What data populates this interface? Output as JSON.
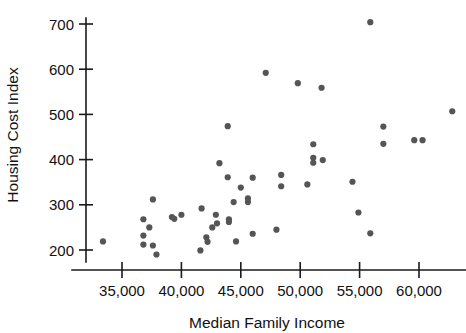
{
  "chart_data": {
    "type": "scatter",
    "title": "",
    "xlabel": "Median Family Income",
    "ylabel": "Housing Cost Index",
    "xlim": [
      32500,
      64000
    ],
    "ylim": [
      175,
      720
    ],
    "grid": false,
    "legend": null,
    "marker_color": "#555555",
    "axis_color": "#1a1a1a",
    "xticks": [
      35000,
      40000,
      45000,
      50000,
      55000,
      60000
    ],
    "xtick_labels": [
      "35,000",
      "40,000",
      "45,000",
      "50,000",
      "55,000",
      "60,000"
    ],
    "yticks": [
      200,
      300,
      400,
      500,
      600,
      700
    ],
    "ytick_labels": [
      "200",
      "300",
      "400",
      "500",
      "600",
      "700"
    ],
    "points": [
      {
        "x": 33400,
        "y": 219
      },
      {
        "x": 36800,
        "y": 268
      },
      {
        "x": 36800,
        "y": 232
      },
      {
        "x": 36800,
        "y": 212
      },
      {
        "x": 37300,
        "y": 250
      },
      {
        "x": 37600,
        "y": 312
      },
      {
        "x": 37600,
        "y": 210
      },
      {
        "x": 37900,
        "y": 190
      },
      {
        "x": 39200,
        "y": 273
      },
      {
        "x": 39400,
        "y": 269
      },
      {
        "x": 40000,
        "y": 278
      },
      {
        "x": 41600,
        "y": 199
      },
      {
        "x": 41700,
        "y": 292
      },
      {
        "x": 42100,
        "y": 228
      },
      {
        "x": 42200,
        "y": 218
      },
      {
        "x": 42600,
        "y": 250
      },
      {
        "x": 42900,
        "y": 278
      },
      {
        "x": 43000,
        "y": 259
      },
      {
        "x": 43200,
        "y": 392
      },
      {
        "x": 43900,
        "y": 474
      },
      {
        "x": 43900,
        "y": 361
      },
      {
        "x": 44000,
        "y": 268
      },
      {
        "x": 44000,
        "y": 262
      },
      {
        "x": 44400,
        "y": 306
      },
      {
        "x": 44600,
        "y": 219
      },
      {
        "x": 45000,
        "y": 338
      },
      {
        "x": 45600,
        "y": 314
      },
      {
        "x": 45600,
        "y": 306
      },
      {
        "x": 46000,
        "y": 360
      },
      {
        "x": 46000,
        "y": 236
      },
      {
        "x": 47100,
        "y": 592
      },
      {
        "x": 48000,
        "y": 245
      },
      {
        "x": 48400,
        "y": 366
      },
      {
        "x": 48400,
        "y": 341
      },
      {
        "x": 49800,
        "y": 569
      },
      {
        "x": 50600,
        "y": 345
      },
      {
        "x": 51100,
        "y": 434
      },
      {
        "x": 51100,
        "y": 404
      },
      {
        "x": 51100,
        "y": 393
      },
      {
        "x": 51800,
        "y": 559
      },
      {
        "x": 51900,
        "y": 399
      },
      {
        "x": 54400,
        "y": 351
      },
      {
        "x": 54900,
        "y": 283
      },
      {
        "x": 55900,
        "y": 704
      },
      {
        "x": 55900,
        "y": 237
      },
      {
        "x": 57000,
        "y": 473
      },
      {
        "x": 57000,
        "y": 435
      },
      {
        "x": 59600,
        "y": 443
      },
      {
        "x": 60300,
        "y": 443
      },
      {
        "x": 62800,
        "y": 507
      }
    ]
  },
  "axes": {
    "x_axis_name": "x-axis",
    "y_axis_name": "y-axis"
  }
}
